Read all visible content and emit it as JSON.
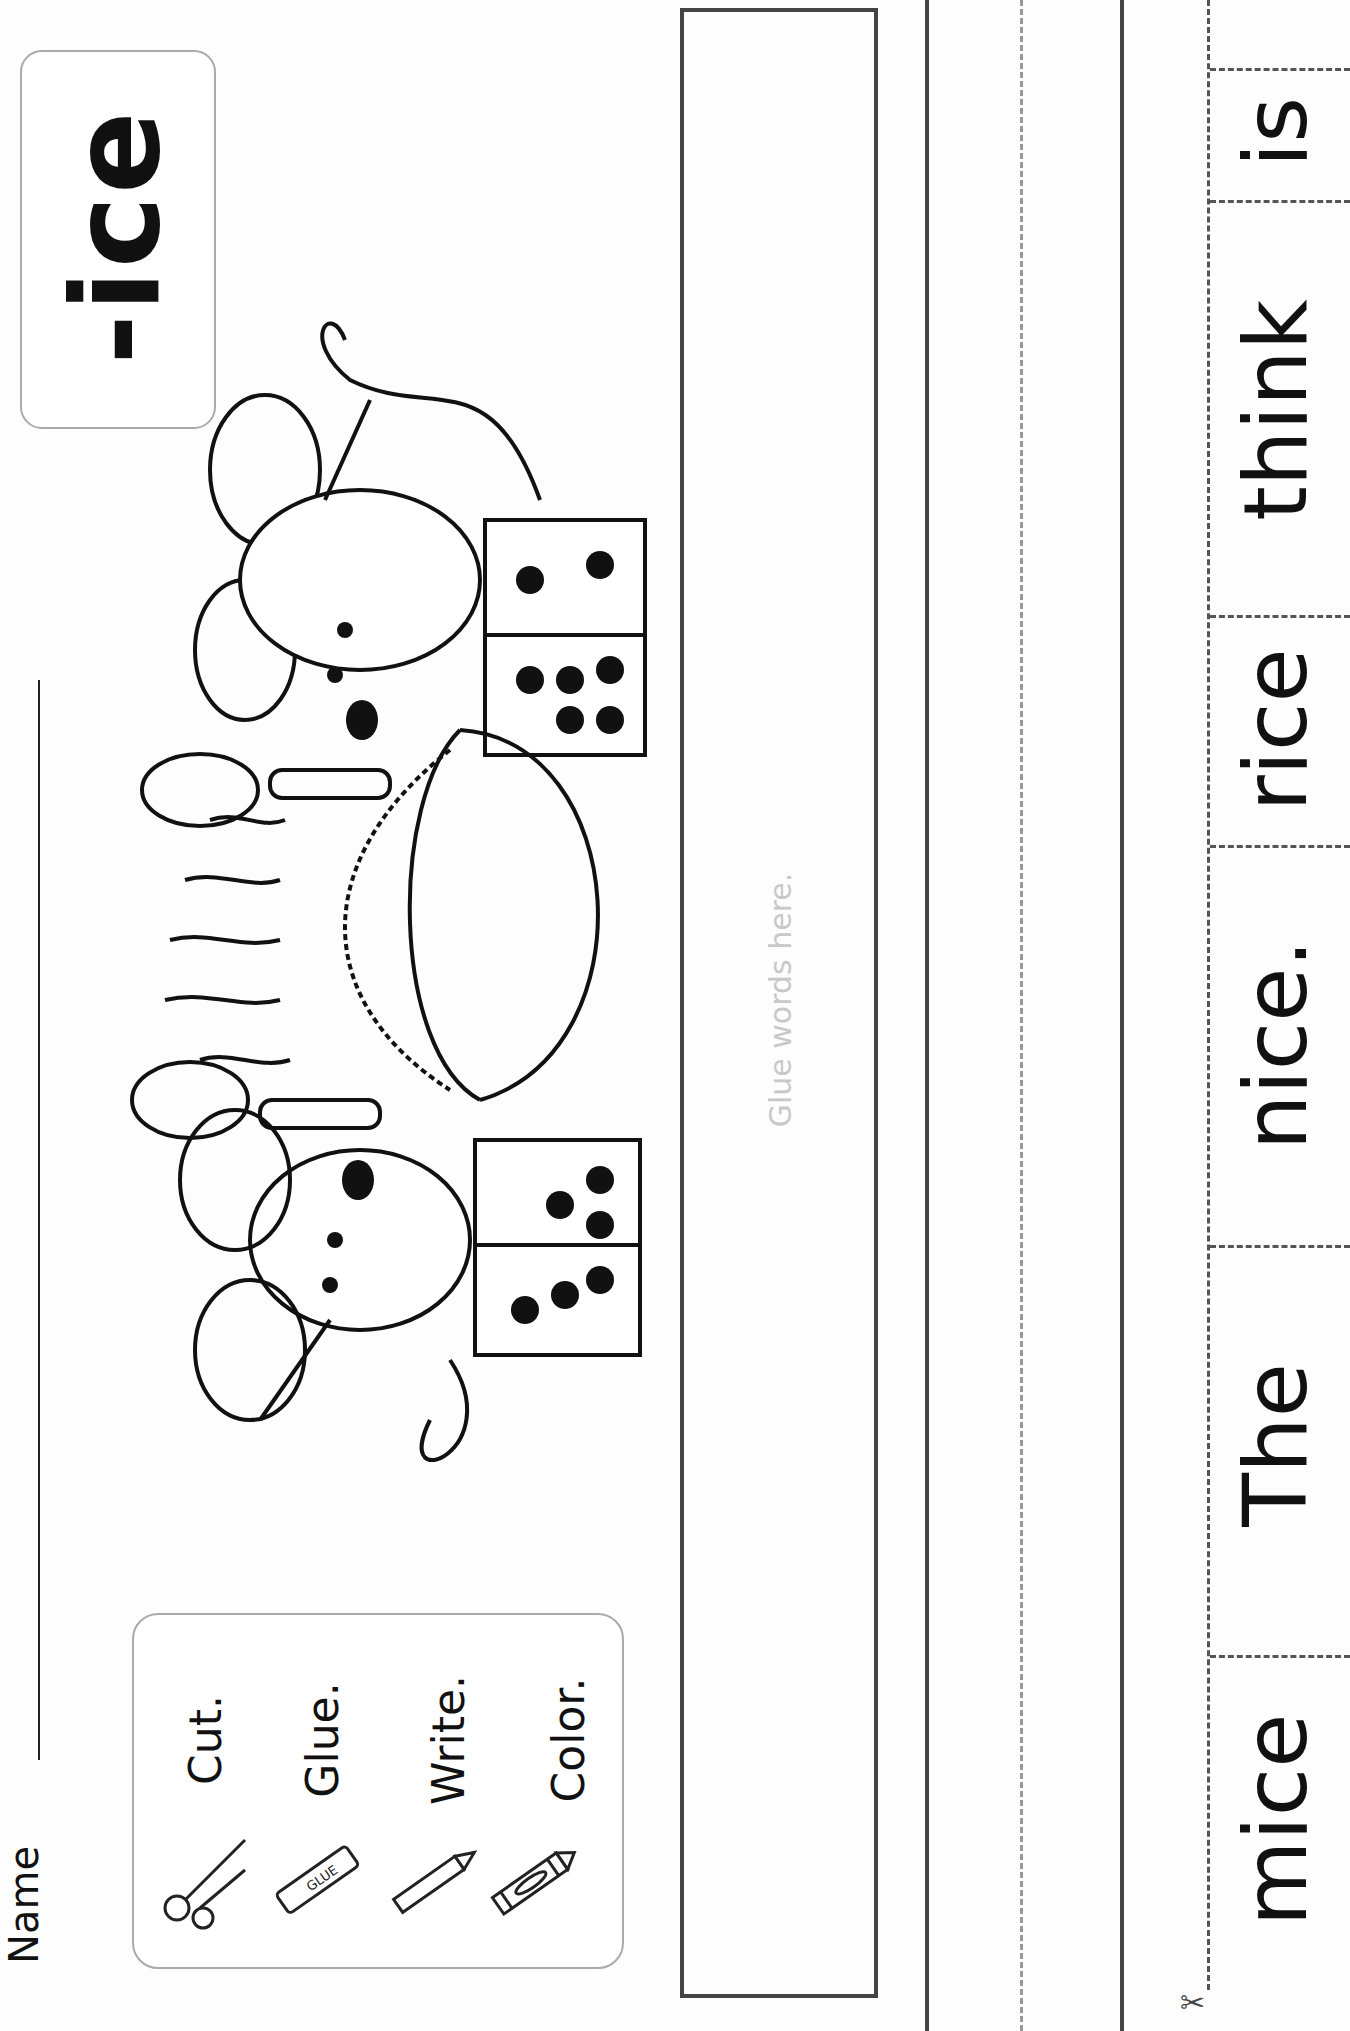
{
  "worksheet": {
    "title": "-ice",
    "name_label": "Name",
    "instructions": [
      {
        "label": "Cut.",
        "icon": "scissors-icon"
      },
      {
        "label": "Glue.",
        "icon": "glue-stick-icon"
      },
      {
        "label": "Write.",
        "icon": "pencil-icon"
      },
      {
        "label": "Color.",
        "icon": "crayon-icon"
      }
    ],
    "glue_stick_label": "GLUE",
    "glue_hint": "Glue words here.",
    "illustration": "two mice with spoons, a pot of rice, and dominoes",
    "word_strip": {
      "words": [
        "mice",
        "The",
        "nice.",
        "rice",
        "think",
        "is"
      ],
      "cut_icon": "scissors-icon"
    }
  }
}
